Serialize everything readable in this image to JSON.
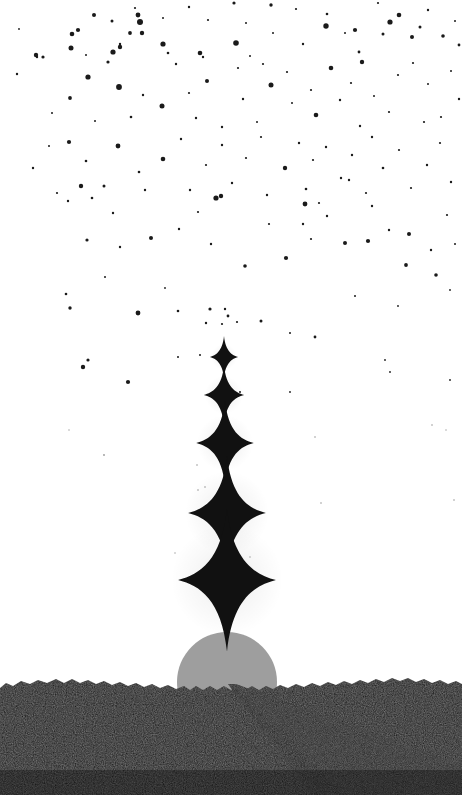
{
  "artwork": {
    "title": "Starry Sunrise Over Desert Road",
    "width": 462,
    "height": 795,
    "medium": "monochrome illustration",
    "orientation": "portrait"
  },
  "palette": {
    "sky": "#ffffff",
    "star": "#111111",
    "speck": "#1a1a1a",
    "sun": "#9e9e9e",
    "ground": "#0d0d0d",
    "ground_highlight": "#151515",
    "road": "#222222",
    "road_edge": "#2a2a2a"
  },
  "sky": {
    "label": "white sky",
    "background_color": "#ffffff",
    "starfield_label": "scattered star specks",
    "speck_count": 210
  },
  "sun": {
    "label": "rising sun disc",
    "color": "#9e9e9e",
    "center_x": 227,
    "center_y": 682,
    "radius": 50
  },
  "ground": {
    "label": "dark rocky foreground",
    "color": "#0d0d0d",
    "horizon_y": 681,
    "texture": "speckled noise"
  },
  "road": {
    "label": "road receding to vanishing point",
    "color": "#222222",
    "vanishing_x": 228,
    "vanishing_y": 684,
    "bottom_left_x": 310,
    "bottom_right_x": 462
  },
  "sparkle_column": {
    "label": "vertical column of four-pointed sparkles",
    "color": "#111111",
    "center_x": 226,
    "stars": [
      {
        "name": "sparkle-1-smallest",
        "cx": 224,
        "cy": 357,
        "size": 20,
        "glow": 26
      },
      {
        "name": "sparkle-2-small",
        "cx": 224,
        "cy": 395,
        "size": 28,
        "glow": 38
      },
      {
        "name": "sparkle-3-medium",
        "cx": 225,
        "cy": 443,
        "size": 40,
        "glow": 56
      },
      {
        "name": "sparkle-4-large",
        "cx": 227,
        "cy": 513,
        "size": 54,
        "glow": 84
      },
      {
        "name": "sparkle-5-largest",
        "cx": 227,
        "cy": 580,
        "size": 68,
        "glow": 112
      }
    ]
  },
  "chart_data": {
    "type": "scatter",
    "xlabel": "image x (px)",
    "ylabel": "image y (px)",
    "xlim": [
      0,
      462
    ],
    "ylim": [
      0,
      360
    ],
    "grid": false,
    "legend": "none",
    "note": "Speck density is highest near the top of the sky and falls toward the sparkle column.",
    "categories": [
      "0-90",
      "90-180",
      "180-270",
      "270-360"
    ],
    "values": [
      92,
      70,
      36,
      12
    ]
  }
}
